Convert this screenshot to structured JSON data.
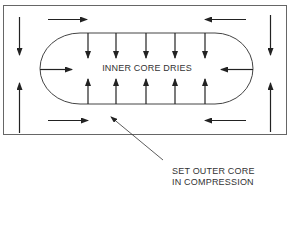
{
  "diagram": {
    "type": "stress-schematic",
    "inner_label": "INNER CORE DRIES",
    "callout": {
      "line1": "SET OUTER CORE",
      "line2": "IN COMPRESSION"
    },
    "colors": {
      "stroke": "#333333",
      "frame": "#666666",
      "background": "#ffffff"
    },
    "outer_frame": {
      "x": 3,
      "y": 5,
      "width": 284,
      "height": 130
    },
    "inner_core": {
      "shape": "stadium",
      "x_left": 40,
      "x_right": 253,
      "y_top": 33,
      "y_bottom": 104
    },
    "inner_arrows": {
      "down_from_top_x": [
        88,
        116,
        146,
        175,
        205
      ],
      "up_from_bottom_x": [
        88,
        116,
        146,
        175,
        205
      ],
      "horizontal": [
        "left-end-pointing-right",
        "right-end-pointing-left"
      ]
    },
    "outer_arrows": [
      {
        "position": "top-left",
        "direction": "right"
      },
      {
        "position": "top-right",
        "direction": "left"
      },
      {
        "position": "bottom-left",
        "direction": "right"
      },
      {
        "position": "bottom-right",
        "direction": "left"
      },
      {
        "position": "left-top",
        "direction": "down"
      },
      {
        "position": "left-bottom",
        "direction": "up"
      },
      {
        "position": "right-top",
        "direction": "down"
      },
      {
        "position": "right-bottom",
        "direction": "up"
      }
    ]
  }
}
